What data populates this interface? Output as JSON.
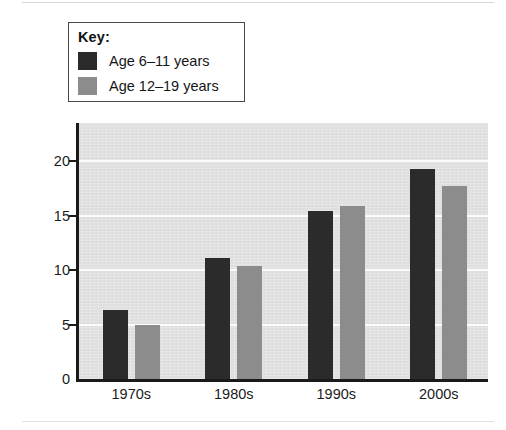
{
  "chart_data": {
    "type": "bar",
    "title": "",
    "xlabel": "",
    "ylabel": "Percent",
    "categories": [
      "1970s",
      "1980s",
      "1990s",
      "2000s"
    ],
    "series": [
      {
        "name": "Age 6–11 years",
        "color": "#2b2b2b",
        "values": [
          6.3,
          11.1,
          15.4,
          19.3
        ]
      },
      {
        "name": "Age 12–19 years",
        "color": "#8c8c8c",
        "values": [
          5.0,
          10.4,
          15.9,
          17.7
        ]
      }
    ],
    "ylim": [
      0,
      23.5
    ],
    "yticks": [
      0,
      5,
      10,
      15,
      20
    ],
    "ytick_labels": [
      "0",
      "5",
      "10",
      "15",
      "20"
    ],
    "grid": "horizontal-white-gridlines",
    "legend_position": "above-plot-left",
    "plot_background": "#dedede"
  },
  "legend": {
    "title": "Key:",
    "entries": [
      {
        "label": "Age 6–11 years",
        "color": "#2b2b2b"
      },
      {
        "label": "Age 12–19 years",
        "color": "#8c8c8c"
      }
    ]
  },
  "axes": {
    "y_title": "Percent",
    "y_labels": [
      "20",
      "15",
      "10",
      "5",
      "0"
    ],
    "x_labels": [
      "1970s",
      "1980s",
      "1990s",
      "2000s"
    ]
  }
}
